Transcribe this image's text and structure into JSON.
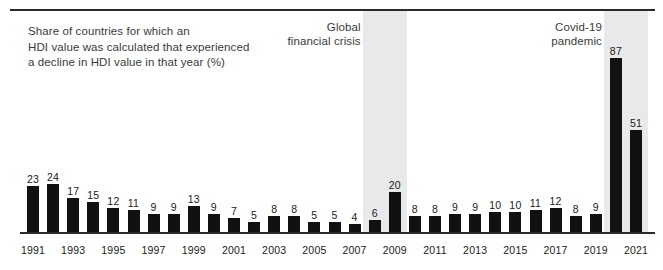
{
  "chart_data": {
    "type": "bar",
    "title": "Share of countries for which an\nHDI value was calculated that experienced\na decline in HDI value in that year (%)",
    "xlabel": "",
    "ylabel": "",
    "ylim": [
      0,
      100
    ],
    "grid": false,
    "legend": "none",
    "categories": [
      "1991",
      "1992",
      "1993",
      "1994",
      "1995",
      "1996",
      "1997",
      "1998",
      "1999",
      "2000",
      "2001",
      "2002",
      "2003",
      "2004",
      "2005",
      "2006",
      "2007",
      "2008",
      "2009",
      "2010",
      "2011",
      "2012",
      "2013",
      "2014",
      "2015",
      "2016",
      "2017",
      "2018",
      "2019",
      "2020",
      "2021"
    ],
    "values": [
      23,
      24,
      17,
      15,
      12,
      11,
      9,
      9,
      13,
      9,
      7,
      5,
      8,
      8,
      5,
      5,
      4,
      6,
      20,
      8,
      8,
      9,
      9,
      10,
      10,
      11,
      12,
      8,
      9,
      87,
      51
    ],
    "tick_labels": [
      "1991",
      "1993",
      "1995",
      "1997",
      "1999",
      "2001",
      "2003",
      "2005",
      "2007",
      "2009",
      "2011",
      "2013",
      "2015",
      "2017",
      "2019",
      "2021"
    ],
    "bar_color": "#111111",
    "annotations": [
      {
        "label": "Global\nfinancial crisis",
        "band_start_year": "2008",
        "band_end_year": "2009",
        "band_color": "#e8e9ea"
      },
      {
        "label": "Covid-19\npandemic",
        "band_start_year": "2020",
        "band_end_year": "2021",
        "band_color": "#e8e9ea"
      }
    ]
  }
}
